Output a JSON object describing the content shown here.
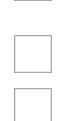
{
  "checkboxes": [
    {
      "id": "checkbox-1",
      "checked": false,
      "partially_visible": true,
      "label": ""
    },
    {
      "id": "checkbox-2",
      "checked": false,
      "partially_visible": false,
      "label": ""
    },
    {
      "id": "checkbox-3",
      "checked": false,
      "partially_visible": true,
      "label": ""
    }
  ],
  "colors": {
    "background": "#ffffff",
    "border": "#a6a6a6",
    "inner_highlight": "#e8e8e8"
  }
}
